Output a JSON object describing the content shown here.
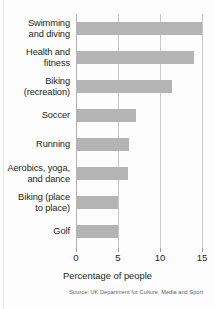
{
  "chart_data": {
    "type": "bar",
    "orientation": "horizontal",
    "title": "",
    "xlabel": "Percentage of people",
    "ylabel": "",
    "xlim": [
      0,
      15
    ],
    "xticks": [
      0,
      5,
      10,
      15
    ],
    "xtick_labels": [
      "0",
      "5",
      "10",
      "15"
    ],
    "grid": true,
    "grid_axis": "x",
    "legend": false,
    "categories": [
      "Swimming and diving",
      "Health and fitness",
      "Biking (recreation)",
      "Soccer",
      "Running",
      "Aerobics, yoga, and dance",
      "Biking (place to place)",
      "Golf"
    ],
    "category_label_lines": [
      [
        "Swimming",
        "and diving"
      ],
      [
        "Health and",
        "fitness"
      ],
      [
        "Biking",
        "(recreation)"
      ],
      [
        "Soccer"
      ],
      [
        "Running"
      ],
      [
        "Aerobics, yoga,",
        "and dance"
      ],
      [
        "Biking (place",
        "to place)"
      ],
      [
        "Golf"
      ]
    ],
    "values": [
      15.0,
      14.0,
      11.4,
      7.1,
      6.3,
      6.2,
      5.0,
      5.0
    ],
    "bar_color": "#b4b4b4",
    "source": "Source: UK Department for Culture, Media and Sport"
  }
}
